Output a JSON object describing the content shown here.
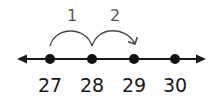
{
  "diagram": {
    "type": "number-line",
    "colors": {
      "line": "#1a1a1a",
      "dot": "#111111",
      "jump_arc": "#444444",
      "jump_label": "#555555",
      "tick_label": "#1a1a1a"
    },
    "points": [
      {
        "value": "27",
        "x": 50
      },
      {
        "value": "28",
        "x": 92
      },
      {
        "value": "29",
        "x": 134
      },
      {
        "value": "30",
        "x": 175
      }
    ],
    "jumps": [
      {
        "label": "1",
        "from": "27",
        "to": "28"
      },
      {
        "label": "2",
        "from": "28",
        "to": "29"
      }
    ],
    "arrows": {
      "left": true,
      "right": true
    }
  }
}
